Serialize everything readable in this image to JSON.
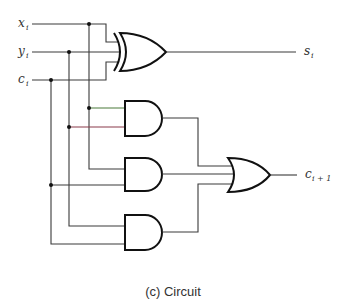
{
  "diagram": {
    "type": "full-adder-circuit",
    "inputs": [
      {
        "name": "x",
        "subscript": "i"
      },
      {
        "name": "y",
        "subscript": "i"
      },
      {
        "name": "c",
        "subscript": "i"
      }
    ],
    "outputs": [
      {
        "name": "s",
        "subscript": "i"
      },
      {
        "name": "c",
        "subscript": "i + 1"
      }
    ],
    "gates": [
      {
        "id": "xor1",
        "type": "XOR",
        "inputs": [
          "x_i",
          "y_i",
          "c_i"
        ],
        "output": "s_i"
      },
      {
        "id": "and1",
        "type": "AND",
        "inputs": [
          "x_i",
          "y_i"
        ]
      },
      {
        "id": "and2",
        "type": "AND",
        "inputs": [
          "x_i",
          "c_i"
        ]
      },
      {
        "id": "and3",
        "type": "AND",
        "inputs": [
          "y_i",
          "c_i"
        ]
      },
      {
        "id": "or1",
        "type": "OR",
        "inputs": [
          "and1",
          "and2",
          "and3"
        ],
        "output": "c_i+1"
      }
    ],
    "colors": {
      "wire": "#3a3a3a",
      "gate": "#111111",
      "accent_green": "#4a7a3a",
      "accent_red": "#8a3a4a"
    }
  },
  "caption": "(c) Circuit"
}
